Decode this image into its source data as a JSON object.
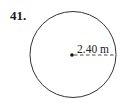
{
  "problem": {
    "number": "41."
  },
  "figure": {
    "shape": "circle",
    "radius_label": "2.40 m",
    "colors": {
      "stroke": "#333333",
      "background": "#ffffff"
    }
  }
}
